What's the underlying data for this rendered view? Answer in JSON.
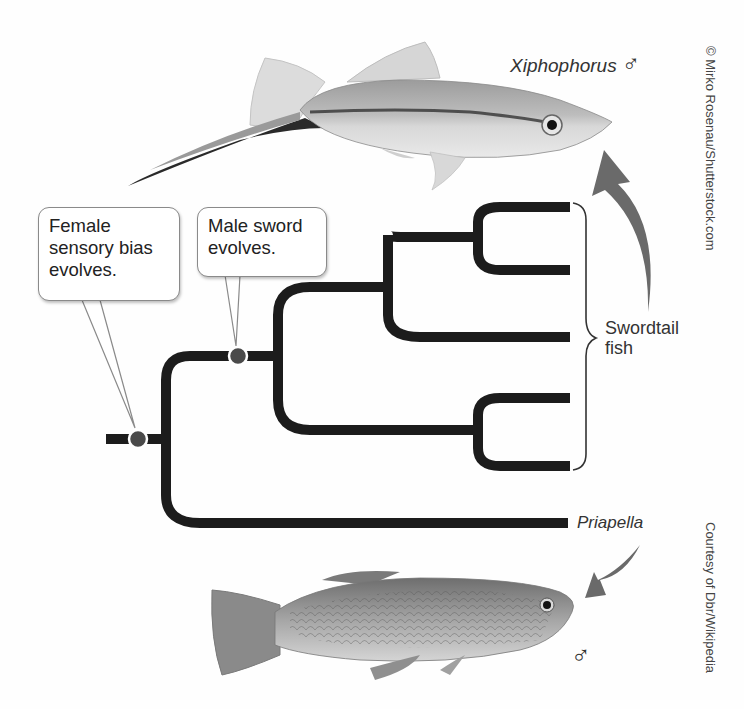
{
  "figure": {
    "callouts": [
      {
        "id": "female-bias",
        "text_lines": [
          "Female",
          "sensory bias",
          "evolves."
        ]
      },
      {
        "id": "male-sword",
        "text_lines": [
          "Male sword",
          "evolves."
        ]
      }
    ],
    "taxa": {
      "top_genus": "Xiphophorus",
      "top_symbol": "♂",
      "clade_label_lines": [
        "Swordtail",
        "fish"
      ],
      "outgroup": "Priapella",
      "bottom_symbol": "♂"
    },
    "credits": {
      "top": "© Mirko Rosenau/Shutterstock.com",
      "bottom": "Courtesy of Dbr/Wikipedia"
    },
    "colors": {
      "branch": "#1c1c1c",
      "event_dot": "#4a4a4a",
      "arrow": "#6a6a6a",
      "callout_border": "#8a8a8a"
    },
    "tree": {
      "tips_swordtail_count": 5,
      "outgroup_count": 1,
      "events": [
        "Female sensory bias evolves (root)",
        "Male sword evolves (swordtail stem)"
      ]
    }
  }
}
